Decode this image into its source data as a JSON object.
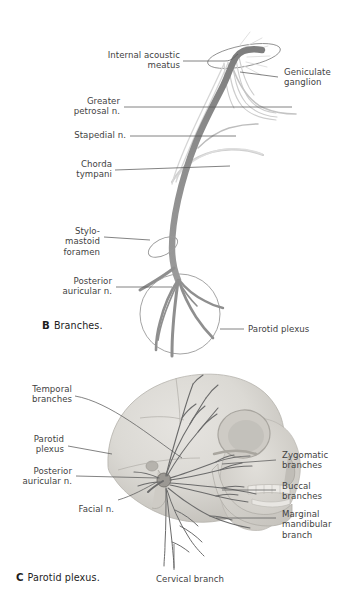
{
  "figure": {
    "colors": {
      "nerve_trunk": "#8c8c8c",
      "nerve_branch_light": "#c9c9c9",
      "skull_fill": "#d9d7d3",
      "skull_shadow": "#bdbbb6",
      "leader_line": "#5a5a5a",
      "label_text": "#3f3f3f",
      "caption_text": "#1d1d1d",
      "background": "#ffffff"
    }
  },
  "panel_b": {
    "caption_letter": "B",
    "caption_text": "Branches.",
    "labels": [
      {
        "id": "internal-acoustic-meatus",
        "text": "Internal acoustic\nmeatus",
        "align": "right"
      },
      {
        "id": "geniculate-ganglion",
        "text": "Geniculate\nganglion",
        "align": "left"
      },
      {
        "id": "greater-petrosal-n",
        "text": "Greater\npetrosal n.",
        "align": "right"
      },
      {
        "id": "stapedial-n",
        "text": "Stapedial n.",
        "align": "right"
      },
      {
        "id": "chorda-tympani",
        "text": "Chorda\ntympani",
        "align": "right"
      },
      {
        "id": "stylomastoid-foramen",
        "text": "Stylo-\nmastoid\nforamen",
        "align": "right"
      },
      {
        "id": "posterior-auricular-n",
        "text": "Posterior\nauricular n.",
        "align": "right"
      },
      {
        "id": "parotid-plexus",
        "text": "Parotid plexus",
        "align": "left"
      }
    ]
  },
  "panel_c": {
    "caption_letter": "C",
    "caption_text": "Parotid plexus.",
    "labels": [
      {
        "id": "temporal-branches",
        "text": "Temporal\nbranches",
        "align": "right"
      },
      {
        "id": "parotid-plexus",
        "text": "Parotid\nplexus",
        "align": "right"
      },
      {
        "id": "posterior-auricular-n",
        "text": "Posterior\nauricular n.",
        "align": "right"
      },
      {
        "id": "facial-n",
        "text": "Facial n.",
        "align": "right"
      },
      {
        "id": "zygomatic-branches",
        "text": "Zygomatic\nbranches",
        "align": "left"
      },
      {
        "id": "buccal-branches",
        "text": "Buccal\nbranches",
        "align": "left"
      },
      {
        "id": "marginal-mandibular",
        "text": "Marginal\nmandibular\nbranch",
        "align": "left"
      },
      {
        "id": "cervical-branch",
        "text": "Cervical branch",
        "align": "left"
      }
    ]
  }
}
